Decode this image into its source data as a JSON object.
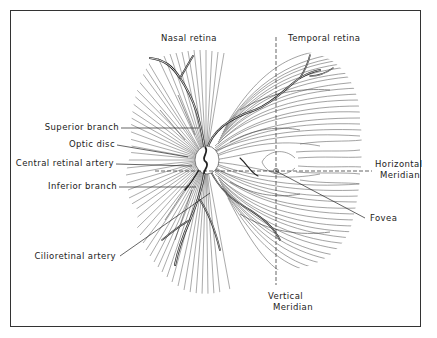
{
  "diagram": {
    "regions": {
      "nasal": "Nasal retina",
      "temporal": "Temporal retina"
    },
    "labels": {
      "superior_branch": "Superior branch",
      "optic_disc": "Optic disc",
      "central_retinal_artery": "Central retinal artery",
      "inferior_branch": "Inferior branch",
      "cilioretinal_artery": "Cilioretinal artery",
      "horizontal_meridian_1": "Horizontal",
      "horizontal_meridian_2": "Meridian",
      "fovea": "Fovea",
      "vertical_meridian_1": "Vertical",
      "vertical_meridian_2": "Meridian"
    },
    "colors": {
      "ink": "#222222",
      "fiber": "#555555",
      "background": "#ffffff"
    }
  }
}
